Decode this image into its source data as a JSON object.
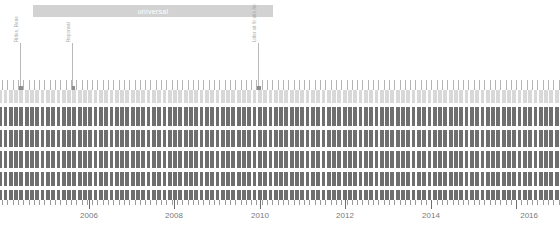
{
  "header": {
    "title": "universal",
    "bar_color": "#d2d2d2",
    "text_color": "#ffffff"
  },
  "annotations": [
    {
      "label": "Rides, Rene",
      "x": 20
    },
    {
      "label": "Reponsal",
      "x": 72
    },
    {
      "label": "Lider sit flr atle Ab",
      "x": 258
    }
  ],
  "chart_data": {
    "type": "bar",
    "title": "universal",
    "xlabel": "",
    "ylabel": "",
    "grid": false,
    "legend_position": "none",
    "x_axis": {
      "tick_labels": [
        "2006",
        "2008",
        "2010",
        "2012",
        "2014",
        "2016"
      ],
      "tick_positions_px": [
        89,
        174,
        260,
        345,
        431,
        516
      ],
      "minor_tick_spacing_px": 5.3,
      "range": [
        2004.6,
        2016.3
      ]
    },
    "bands": [
      {
        "name": "row-1",
        "color": "#d8d8d8",
        "top": 90,
        "height": 13
      },
      {
        "name": "row-2",
        "color": "#6f6f6f",
        "top": 107,
        "height": 19
      },
      {
        "name": "row-3",
        "color": "#6f6f6f",
        "top": 130,
        "height": 17
      },
      {
        "name": "row-4",
        "color": "#6f6f6f",
        "top": 151,
        "height": 17
      },
      {
        "name": "row-5",
        "color": "#6f6f6f",
        "top": 172,
        "height": 14
      },
      {
        "name": "row-6",
        "color": "#6f6f6f",
        "top": 190,
        "height": 10
      }
    ],
    "notch_spacing_px": 5.3,
    "tick_color": "#b5b5b5",
    "notch_color": "#ffffff"
  }
}
